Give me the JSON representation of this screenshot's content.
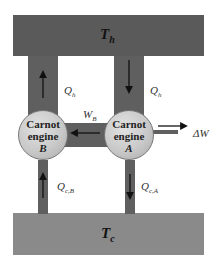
{
  "diagram": {
    "hot_reservoir": {
      "label": "T",
      "sub": "h",
      "color": "#5a5a5a"
    },
    "cold_reservoir": {
      "label": "T",
      "sub": "c",
      "color": "#8a8a8a"
    },
    "engine_b": {
      "line1": "Carnot",
      "line2": "engine",
      "id": "B"
    },
    "engine_a": {
      "line1": "Carnot",
      "line2": "engine",
      "id": "A"
    },
    "labels": {
      "qh_left": {
        "main": "Q",
        "sub": "h"
      },
      "qh_right": {
        "main": "Q",
        "sub": "h"
      },
      "wb": {
        "main": "W",
        "sub": "B"
      },
      "delta_w": "ΔW",
      "qc_b": {
        "main": "Q",
        "sub": "c,B"
      },
      "qc_a": {
        "main": "Q",
        "sub": "c,A"
      }
    },
    "flows": [
      {
        "from": "engine_b",
        "to": "hot_reservoir",
        "label": "Q_h"
      },
      {
        "from": "hot_reservoir",
        "to": "engine_a",
        "label": "Q_h"
      },
      {
        "from": "engine_a",
        "to": "engine_b",
        "label": "W_B"
      },
      {
        "from": "engine_a",
        "to": "output",
        "label": "ΔW"
      },
      {
        "from": "cold_reservoir",
        "to": "engine_b",
        "label": "Q_c,B"
      },
      {
        "from": "engine_a",
        "to": "cold_reservoir",
        "label": "Q_c,A"
      }
    ]
  }
}
